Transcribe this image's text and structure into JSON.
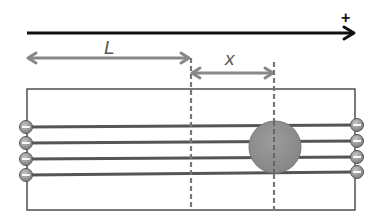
{
  "diagram": {
    "axis": {
      "direction_label": "+",
      "color": "#111111"
    },
    "dimensions": [
      {
        "id": "L",
        "label": "L",
        "from": "left-end",
        "to": "reference-line"
      },
      {
        "id": "x",
        "label": "x",
        "from": "reference-line",
        "to": "ball-center"
      }
    ],
    "box": {
      "stroke": "#333333"
    },
    "wires": {
      "count": 4,
      "color": "#555555"
    },
    "left_charges": {
      "count": 4,
      "symbol": "minus",
      "fill": "#8a8a8a"
    },
    "right_charges": {
      "count": 4,
      "symbol": "minus",
      "fill": "#8a8a8a"
    },
    "ball": {
      "fill": "#8f8f8f",
      "stroke": "#777777"
    },
    "dashed_lines": {
      "count": 2,
      "color": "#777777"
    },
    "dimension_color": "#888888"
  }
}
